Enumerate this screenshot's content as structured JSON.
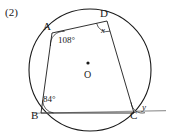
{
  "problem": {
    "number": "(2)"
  },
  "figure": {
    "type": "circle-geometry",
    "stroke_color": "#1a1a1a",
    "secant_color": "#8a8a8a",
    "vertices": {
      "A": {
        "label": "A",
        "x": 52,
        "y": 33
      },
      "B": {
        "label": "B",
        "x": 41,
        "y": 113
      },
      "C": {
        "label": "C",
        "x": 134,
        "y": 113
      },
      "D": {
        "label": "D",
        "x": 107,
        "y": 21
      },
      "O": {
        "label": "O",
        "x": 88,
        "y": 68
      }
    },
    "circle": {
      "cx": 90,
      "cy": 70,
      "r": 61
    },
    "center_dot": {
      "cx": 88,
      "cy": 63,
      "r": 1.6
    },
    "secant_line": {
      "x1": 34,
      "y1": 113,
      "x2": 166,
      "y2": 110
    },
    "angles": [
      {
        "name": "angle-at-A",
        "label": "108°",
        "vertex": "A",
        "value": 108,
        "unit": "degrees",
        "marked": true
      },
      {
        "name": "angle-at-B",
        "label": "84°",
        "vertex": "B",
        "value": 84,
        "unit": "degrees",
        "marked": true
      },
      {
        "name": "angle-at-D",
        "label": "x",
        "vertex": "D",
        "value": null,
        "unit": "unknown",
        "marked": true
      },
      {
        "name": "exterior-angle-at-C",
        "label": "y",
        "vertex": "C",
        "value": null,
        "unit": "unknown",
        "marked": true
      }
    ]
  }
}
